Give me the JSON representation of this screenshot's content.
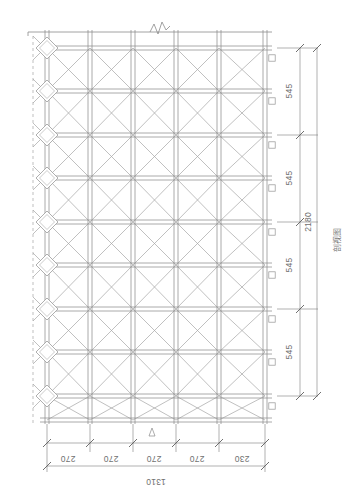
{
  "drawing": {
    "title_label": "剖视图",
    "line_color": "#9a9a9a",
    "dim_color": "#6f6f6f",
    "background": "#ffffff"
  },
  "vertical_dimensions": {
    "name": "right-dimension-chain",
    "segments": [
      {
        "label": "545",
        "value": 545
      },
      {
        "label": "545",
        "value": 545
      },
      {
        "label": "545",
        "value": 545
      },
      {
        "label": "545",
        "value": 545
      }
    ],
    "total": {
      "label": "2180",
      "value": 2180,
      "unit": "mm"
    }
  },
  "horizontal_dimensions": {
    "name": "bottom-dimension-chain",
    "segments": [
      {
        "label": "270",
        "value": 270
      },
      {
        "label": "270",
        "value": 270
      },
      {
        "label": "270",
        "value": 270
      },
      {
        "label": "270",
        "value": 270
      },
      {
        "label": "230",
        "value": 230
      }
    ],
    "total": {
      "label": "1310",
      "value": 1310,
      "unit": "mm"
    }
  },
  "structure": {
    "bays_horizontal": 5,
    "panels_vertical": 9,
    "node_plates": 9,
    "break_symbol": "zigzag-break",
    "bracing": "x-cross"
  }
}
